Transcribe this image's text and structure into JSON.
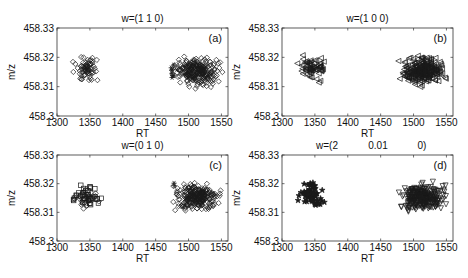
{
  "chart_data": [
    {
      "type": "scatter",
      "panel_label": "(a)",
      "title": "w=(1  1  0)",
      "xlabel": "RT",
      "ylabel": "m/z",
      "xlim": [
        1300,
        1560
      ],
      "ylim": [
        458.3,
        458.33
      ],
      "xticks": [
        "1300",
        "1350",
        "1400",
        "1450",
        "1500",
        "1550"
      ],
      "yticks": [
        "458.3",
        "458.31",
        "458.32",
        "458.33"
      ],
      "grid": false,
      "series": [
        {
          "name": "cluster 1",
          "marker": "diamond",
          "x_range": [
            1318,
            1372
          ],
          "y_range": [
            458.3105,
            458.3215
          ],
          "n": 70
        },
        {
          "name": "cluster 2",
          "marker": "diamond",
          "x_range": [
            1470,
            1556
          ],
          "y_range": [
            458.309,
            458.3215
          ],
          "n": 260
        },
        {
          "name": "outliers",
          "marker": "asterisk",
          "x_range": [
            1470,
            1482
          ],
          "y_range": [
            458.311,
            458.322
          ],
          "n": 8
        }
      ]
    },
    {
      "type": "scatter",
      "panel_label": "(b)",
      "title": "w=(1  0  0)",
      "xlabel": "RT",
      "ylabel": "m/z",
      "xlim": [
        1300,
        1560
      ],
      "ylim": [
        458.3,
        458.33
      ],
      "xticks": [
        "1300",
        "1350",
        "1400",
        "1450",
        "1500",
        "1550"
      ],
      "yticks": [
        "458.3",
        "458.31",
        "458.32",
        "458.33"
      ],
      "grid": false,
      "series": [
        {
          "name": "cluster 1",
          "marker": "triangle-left",
          "x_range": [
            1318,
            1372
          ],
          "y_range": [
            458.3105,
            458.3215
          ],
          "n": 70
        },
        {
          "name": "cluster 2",
          "marker": "triangle-left",
          "x_range": [
            1470,
            1556
          ],
          "y_range": [
            458.309,
            458.3215
          ],
          "n": 260
        }
      ]
    },
    {
      "type": "scatter",
      "panel_label": "(c)",
      "title": "w=(0  1  0)",
      "xlabel": "RT",
      "ylabel": "m/z",
      "xlim": [
        1300,
        1560
      ],
      "ylim": [
        458.3,
        458.33
      ],
      "xticks": [
        "1300",
        "1350",
        "1400",
        "1450",
        "1500",
        "1550"
      ],
      "yticks": [
        "458.3",
        "458.31",
        "458.32",
        "458.33"
      ],
      "grid": false,
      "series": [
        {
          "name": "cluster 1",
          "marker": "square",
          "x_range": [
            1318,
            1372
          ],
          "y_range": [
            458.3105,
            458.3215
          ],
          "n": 40
        },
        {
          "name": "cluster 1b",
          "marker": "diamond",
          "x_range": [
            1318,
            1372
          ],
          "y_range": [
            458.3105,
            458.3205
          ],
          "n": 30
        },
        {
          "name": "cluster 2",
          "marker": "diamond",
          "x_range": [
            1470,
            1556
          ],
          "y_range": [
            458.309,
            458.3215
          ],
          "n": 260
        },
        {
          "name": "outliers",
          "marker": "asterisk",
          "x_range": [
            1475,
            1482
          ],
          "y_range": [
            458.3185,
            458.3225
          ],
          "n": 2
        }
      ]
    },
    {
      "type": "scatter",
      "panel_label": "(d)",
      "title": "w=(2        0.01          0)",
      "title_parts": [
        "w=(2",
        "0.01",
        "0)"
      ],
      "xlabel": "RT",
      "ylabel": "m/z",
      "xlim": [
        1300,
        1560
      ],
      "ylim": [
        458.3,
        458.33
      ],
      "xticks": [
        "1300",
        "1350",
        "1400",
        "1450",
        "1500",
        "1550"
      ],
      "yticks": [
        "458.3",
        "458.31",
        "458.32",
        "458.33"
      ],
      "grid": false,
      "series": [
        {
          "name": "cluster 1",
          "marker": "star",
          "x_range": [
            1318,
            1372
          ],
          "y_range": [
            458.3105,
            458.3215
          ],
          "n": 70
        },
        {
          "name": "cluster 2",
          "marker": "triangle-down",
          "x_range": [
            1470,
            1556
          ],
          "y_range": [
            458.309,
            458.3215
          ],
          "n": 260
        }
      ]
    }
  ],
  "layout": {
    "panels": [
      {
        "left": 57,
        "top": 28,
        "right": 228,
        "bottom": 116
      },
      {
        "left": 282,
        "top": 28,
        "right": 453,
        "bottom": 116
      },
      {
        "left": 57,
        "top": 155,
        "right": 228,
        "bottom": 241
      },
      {
        "left": 282,
        "top": 155,
        "right": 453,
        "bottom": 241
      }
    ],
    "colors": {
      "axis": "#333333",
      "marker": "#1a1a1a",
      "background": "#ffffff"
    }
  }
}
